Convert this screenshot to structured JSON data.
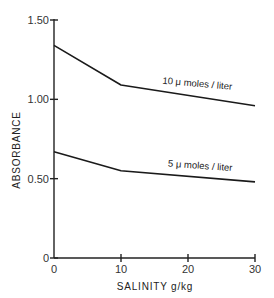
{
  "chart_data": {
    "type": "line",
    "title": "",
    "xlabel": "SALINITY g/kg",
    "ylabel": "ABSORBANCE",
    "xlim": [
      0,
      30
    ],
    "ylim": [
      0,
      1.5
    ],
    "x_ticks": [
      "0",
      "10",
      "20",
      "30"
    ],
    "x_tick_values": [
      0,
      10,
      20,
      30
    ],
    "y_ticks": [
      "0",
      "0.50",
      "1.00",
      "1.50"
    ],
    "y_tick_values": [
      0,
      0.5,
      1.0,
      1.5
    ],
    "grid": false,
    "legend": "inline labels",
    "x": [
      0,
      10,
      30
    ],
    "series": [
      {
        "name": "10 μ moles / liter",
        "label_text": "10 μ moles / liter",
        "values": [
          1.34,
          1.09,
          0.96
        ]
      },
      {
        "name": "5 μ moles / liter",
        "label_text": "5 μ moles / liter",
        "values": [
          0.67,
          0.55,
          0.48
        ]
      }
    ]
  }
}
